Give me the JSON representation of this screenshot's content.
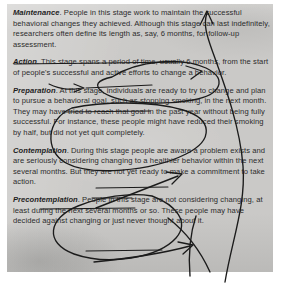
{
  "document": {
    "kind": "photocopied-textbook-excerpt",
    "topic": "Stages of change",
    "page_bg_color": "#c9c8c6",
    "ink_color": "#1b1b1b",
    "text_color": "#2c2c2c"
  },
  "paragraphs": [
    {
      "stage": "Maintenance",
      "body": ". People in this stage work to maintain the successful behavioral changes they achieved. Although this stage can last indefinitely, researchers often define its length as, say, 6 months, for follow-up assessment."
    },
    {
      "stage": "Action",
      "body": ". This stage spans a period of time, usually 6 months, from the start of people's successful and active efforts to change a behavior."
    },
    {
      "stage": "Preparation",
      "body": ". At this stage, individuals are ready to try to change and plan to pursue a behavioral goal, such as stopping smoking, in the next month. They may have tried to reach that goal in the past year without being fully successful. For instance, these people might have reduced their smoking by half, but did not yet quit completely."
    },
    {
      "stage": "Contemplation",
      "body": ". During this stage people are aware a problem exists and are seriously considering changing to a healthier behavior within the next several months. But they are not yet ready to make a commitment to take action."
    },
    {
      "stage": "Precontemplation",
      "body": ". People in this stage are not considering changing, at least during the next several months or so. These people may have decided against changing or just never thought about it."
    }
  ],
  "annotations": {
    "description": "Hand-drawn pen marks over the printed text",
    "marks": [
      {
        "name": "loop-precontemplation-to-contemplation",
        "type": "curved-arrow",
        "from": "Precontemplation",
        "to": "Contemplation"
      },
      {
        "name": "loop-contemplation-to-preparation",
        "type": "curved-arrow",
        "from": "Contemplation",
        "to": "Preparation"
      },
      {
        "name": "loop-preparation-to-action",
        "type": "curved-arrow",
        "from": "Preparation",
        "to": "Action"
      },
      {
        "name": "loop-action-to-maintenance",
        "type": "curved-arrow",
        "from": "Action",
        "to": "Maintenance"
      },
      {
        "name": "underline-follow-up-assessment",
        "type": "underline",
        "target": "for follow-up assessment."
      },
      {
        "name": "strikethrough-at-this-stage-individuals",
        "type": "strikethrough",
        "target": "At this stage, individuals"
      },
      {
        "name": "underline-during-this-stage-people",
        "type": "underline",
        "target": "During this stage people"
      },
      {
        "name": "underline-considering",
        "type": "underline",
        "target": "considering"
      },
      {
        "name": "underline-within-the-next-several-months",
        "type": "underline",
        "target": "within the next several months"
      },
      {
        "name": "strikethrough-decided-against-changing",
        "type": "strikethrough",
        "target": "decided against changing"
      }
    ]
  }
}
